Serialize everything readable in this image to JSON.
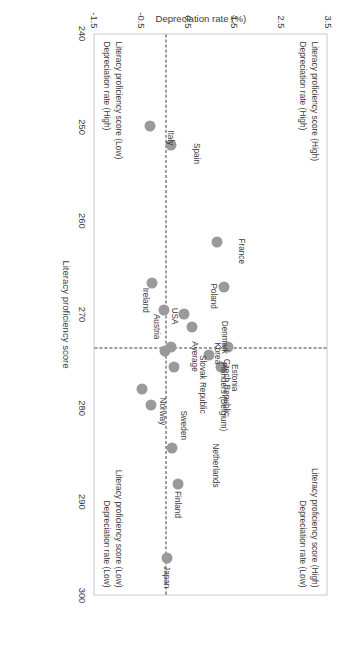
{
  "chart_data": {
    "type": "scatter",
    "title": "",
    "xlabel": "Literacy proficiency score",
    "ylabel": "Depreciation rate (%)",
    "xlim": [
      240,
      300
    ],
    "ylim": [
      -1.5,
      3.5
    ],
    "xticks": [
      "240",
      "250",
      "260",
      "270",
      "280",
      "290",
      "300"
    ],
    "yticks": [
      "3.5",
      "2.5",
      "1.5",
      "0.5",
      "-0.5",
      "-1.5"
    ],
    "grid": false,
    "legend": "none",
    "reference_lines": {
      "vertical_x": 273.4,
      "horizontal_y": 0.08
    },
    "points": [
      {
        "label": "Japan",
        "x": 295.9,
        "y": 0.1,
        "lx": 8,
        "ly": -2
      },
      {
        "label": "Finland",
        "x": 288.0,
        "y": 0.33,
        "lx": 7,
        "ly": -2
      },
      {
        "label": "Netherlands",
        "x": 284.1,
        "y": 0.2,
        "lx": -4,
        "ly": -46
      },
      {
        "label": "Sweden",
        "x": 279.6,
        "y": -0.25,
        "lx": 5,
        "ly": -36
      },
      {
        "label": "Norway",
        "x": 277.9,
        "y": -0.45,
        "lx": 8,
        "ly": -24
      },
      {
        "label": "Estonia",
        "x": 275.5,
        "y": 1.25,
        "lx": -3,
        "ly": -16
      },
      {
        "label": "Czech Republic",
        "x": 274.2,
        "y": 1.0,
        "lx": 4,
        "ly": -20
      },
      {
        "label": "Flanders (Belgium)",
        "x": 275.5,
        "y": 0.25,
        "lx": -5,
        "ly": -52
      },
      {
        "label": "Slovak Republic",
        "x": 273.8,
        "y": 0.05,
        "lx": 4,
        "ly": -40
      },
      {
        "label": "Average",
        "x": 273.4,
        "y": 0.18,
        "lx": -6,
        "ly": -26
      },
      {
        "label": "Korea",
        "x": 273.4,
        "y": 1.4,
        "lx": -5,
        "ly": 8
      },
      {
        "label": "Denmark",
        "x": 271.2,
        "y": 0.62,
        "lx": -6,
        "ly": -36
      },
      {
        "label": "USA",
        "x": 269.8,
        "y": 0.45,
        "lx": -6,
        "ly": 6
      },
      {
        "label": "Austria",
        "x": 269.4,
        "y": 0.02,
        "lx": 4,
        "ly": 4
      },
      {
        "label": "Poland",
        "x": 267.0,
        "y": 1.32,
        "lx": -4,
        "ly": 8
      },
      {
        "label": "Ireland",
        "x": 266.5,
        "y": -0.22,
        "lx": 5,
        "ly": 4
      },
      {
        "label": "France",
        "x": 262.1,
        "y": 1.15,
        "lx": -3,
        "ly": -28
      },
      {
        "label": "Spain",
        "x": 251.8,
        "y": 0.18,
        "lx": -2,
        "ly": -28
      },
      {
        "label": "Italy",
        "x": 249.8,
        "y": -0.28,
        "lx": 4,
        "ly": -24
      }
    ],
    "quadrant_captions": {
      "top_left": [
        "Literacy proficiency score (High)",
        "Depreciation rate (High)"
      ],
      "top_right": [
        "Literacy proficiency score (High)",
        "Depreciation rate (Low)"
      ],
      "bottom_left": [
        "Literacy proficiency score (Low)",
        "Depreciation rate (High)"
      ],
      "bottom_right": [
        "Literacy proficiency score (Low)",
        "Depreciation rate (Low)"
      ]
    },
    "colors": {
      "marker": "#9a9a9a",
      "text": "#3b3b3b",
      "frame": "#c9c9c9",
      "dash": "#3a3a3a"
    }
  }
}
